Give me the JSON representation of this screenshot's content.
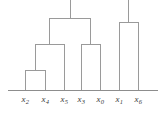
{
  "figure": {
    "kind": "dendrogram",
    "background_color": "#ffffff",
    "line_color": "#9a9a9a",
    "axis_color": "#8d8d8d",
    "label_color": "#3a3a3a",
    "width": 165,
    "height": 115
  },
  "chart_data": {
    "type": "dendrogram",
    "title": "",
    "xlabel": "",
    "ylabel": "",
    "grid": false,
    "legend": null,
    "baseline_y": 90,
    "orientation": "vertical",
    "leaves": [
      {
        "id": "x2",
        "label": "x",
        "subscript": "2",
        "x": 25
      },
      {
        "id": "x4",
        "label": "x",
        "subscript": "4",
        "x": 45
      },
      {
        "id": "x5",
        "label": "x",
        "subscript": "5",
        "x": 64
      },
      {
        "id": "x3",
        "label": "x",
        "subscript": "3",
        "x": 81
      },
      {
        "id": "x0",
        "label": "x",
        "subscript": "0",
        "x": 100
      },
      {
        "id": "x1",
        "label": "x",
        "subscript": "1",
        "x": 119
      },
      {
        "id": "x6",
        "label": "x",
        "subscript": "6",
        "x": 138
      }
    ],
    "tick_labels": [
      "x2",
      "x4",
      "x5",
      "x3",
      "x0",
      "x1",
      "x6"
    ],
    "merges": [
      {
        "id": "m1",
        "left": 25,
        "right": 45,
        "y": 70,
        "center": 35,
        "members": [
          "x2",
          "x4"
        ]
      },
      {
        "id": "m2",
        "left": 35,
        "right": 64,
        "y": 44,
        "center": 49.5,
        "members": [
          "m1",
          "x5"
        ]
      },
      {
        "id": "m3",
        "left": 81,
        "right": 100,
        "y": 44,
        "center": 90.5,
        "members": [
          "x3",
          "x0"
        ]
      },
      {
        "id": "m4",
        "left": 49.5,
        "right": 90.5,
        "y": 18,
        "center": 70,
        "members": [
          "m2",
          "m3"
        ]
      },
      {
        "id": "m5",
        "left": 119,
        "right": 138,
        "y": 22,
        "center": 128.5,
        "members": [
          "x1",
          "x6"
        ]
      }
    ],
    "root_stems": [
      {
        "from": "m4",
        "x": 70,
        "y_top": 0,
        "y_bottom": 18
      },
      {
        "from": "m5",
        "x": 128.5,
        "y_top": 0,
        "y_bottom": 22
      }
    ],
    "axis": {
      "x_start": 8,
      "x_end": 158,
      "y": 90
    }
  }
}
